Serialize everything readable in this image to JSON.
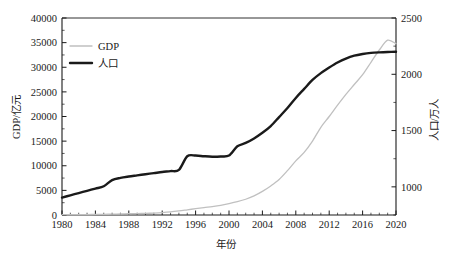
{
  "chart_data": {
    "type": "line",
    "title": "",
    "xlabel": "年份",
    "ylabel": "GDP/亿元",
    "y2label": "人口/万人",
    "xlim": [
      1980,
      2020
    ],
    "ylim": [
      0,
      40000
    ],
    "y2lim": [
      750,
      2500
    ],
    "grid": false,
    "legend_position": "top-left",
    "xticks": [
      "1980",
      "1984",
      "1988",
      "1992",
      "1996",
      "2000",
      "2004",
      "2008",
      "2012",
      "2016",
      "2020"
    ],
    "xtick_values": [
      1980,
      1984,
      1988,
      1992,
      1996,
      2000,
      2004,
      2008,
      2012,
      2016,
      2020
    ],
    "yticks": [
      "0",
      "5000",
      "10000",
      "15000",
      "20000",
      "25000",
      "30000",
      "35000",
      "40000"
    ],
    "ytick_values": [
      0,
      5000,
      10000,
      15000,
      20000,
      25000,
      30000,
      35000,
      40000
    ],
    "y2ticks": [
      "1000",
      "1500",
      "2000",
      "2500"
    ],
    "y2tick_values": [
      1000,
      1500,
      2000,
      2500
    ],
    "x": [
      1980,
      1981,
      1982,
      1983,
      1984,
      1985,
      1986,
      1987,
      1988,
      1989,
      1990,
      1991,
      1992,
      1993,
      1994,
      1995,
      1996,
      1997,
      1998,
      1999,
      2000,
      2001,
      2002,
      2003,
      2004,
      2005,
      2006,
      2007,
      2008,
      2009,
      2010,
      2011,
      2012,
      2013,
      2014,
      2015,
      2016,
      2017,
      2018,
      2019,
      2020
    ],
    "series": [
      {
        "name": "GDP",
        "axis": "left",
        "unit": "亿元",
        "color": "#c0c0c0",
        "width": 1.3,
        "values": [
          60,
          70,
          80,
          95,
          115,
          140,
          165,
          200,
          250,
          290,
          330,
          390,
          480,
          620,
          820,
          1050,
          1280,
          1500,
          1700,
          1950,
          2300,
          2700,
          3200,
          3900,
          4800,
          5900,
          7200,
          9000,
          11000,
          12700,
          15000,
          17800,
          20000,
          22300,
          24500,
          26500,
          28500,
          31000,
          33500,
          35500,
          34800
        ]
      },
      {
        "name": "人口",
        "axis": "right",
        "unit": "万人",
        "color": "#1a1a1a",
        "width": 2.4,
        "values": [
          905,
          925,
          945,
          965,
          985,
          1005,
          1060,
          1080,
          1092,
          1102,
          1112,
          1122,
          1132,
          1140,
          1150,
          1272,
          1278,
          1272,
          1268,
          1270,
          1278,
          1360,
          1390,
          1430,
          1480,
          1540,
          1620,
          1700,
          1790,
          1870,
          1950,
          2010,
          2060,
          2105,
          2140,
          2165,
          2180,
          2190,
          2195,
          2198,
          2200
        ]
      }
    ],
    "legend": [
      {
        "label": "GDP",
        "color": "#c0c0c0",
        "width": 1.3
      },
      {
        "label": "人口",
        "color": "#1a1a1a",
        "width": 2.4
      }
    ],
    "annotations": []
  }
}
